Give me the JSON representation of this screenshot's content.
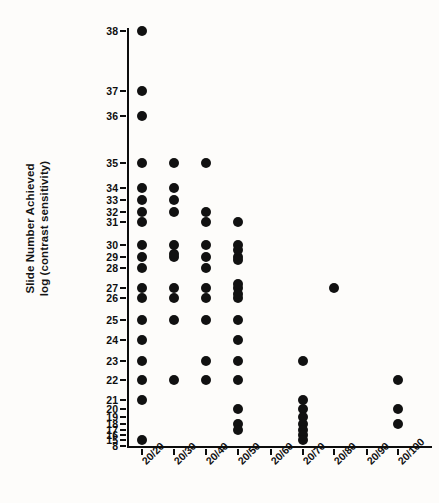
{
  "chart_data": {
    "type": "scatter",
    "title": "",
    "subtitle": "",
    "xlabel": "",
    "ylabel": "Slide Number Achieved\nlog (contrast sensitivity)",
    "grid": false,
    "legend": null,
    "x_categories": [
      "20/20",
      "20/30",
      "20/40",
      "20/50",
      "20/60",
      "20/70",
      "20/80",
      "20/90",
      "20/100"
    ],
    "y_tick_labels": [
      "38",
      "37",
      "36",
      "35",
      "34",
      "33",
      "32",
      "31",
      "30",
      "29",
      "28",
      "27",
      "26",
      "25",
      "24",
      "23",
      "22",
      "21",
      "20",
      "19",
      "18",
      "17",
      "16",
      "15",
      "8"
    ],
    "y_axis_note": "non-linear (log contrast sensitivity) spacing",
    "y_axis_pixel_positions": [
      3,
      63,
      88,
      135,
      160,
      172,
      184,
      194,
      217,
      229,
      240,
      260,
      270,
      292,
      312,
      333,
      352,
      372,
      381,
      389,
      396,
      402,
      407,
      412,
      418
    ],
    "x_axis_pixel_positions": [
      15,
      47,
      79,
      111,
      144,
      176,
      207,
      240,
      271
    ],
    "marker": {
      "shape": "circle",
      "color": "#111111",
      "size_px": 10
    },
    "points": [
      {
        "x": "20/20",
        "y": "38"
      },
      {
        "x": "20/20",
        "y": "37"
      },
      {
        "x": "20/20",
        "y": "36"
      },
      {
        "x": "20/20",
        "y": "35"
      },
      {
        "x": "20/20",
        "y": "34"
      },
      {
        "x": "20/20",
        "y": "33"
      },
      {
        "x": "20/20",
        "y": "32"
      },
      {
        "x": "20/20",
        "y": "31"
      },
      {
        "x": "20/20",
        "y": "30"
      },
      {
        "x": "20/20",
        "y": "29"
      },
      {
        "x": "20/20",
        "y": "28"
      },
      {
        "x": "20/20",
        "y": "27"
      },
      {
        "x": "20/20",
        "y": "26"
      },
      {
        "x": "20/20",
        "y": "25"
      },
      {
        "x": "20/20",
        "y": "24"
      },
      {
        "x": "20/20",
        "y": "23"
      },
      {
        "x": "20/20",
        "y": "22"
      },
      {
        "x": "20/20",
        "y": "21"
      },
      {
        "x": "20/20",
        "y": "15"
      },
      {
        "x": "20/30",
        "y": "35"
      },
      {
        "x": "20/30",
        "y": "34"
      },
      {
        "x": "20/30",
        "y": "33"
      },
      {
        "x": "20/30",
        "y": "32"
      },
      {
        "x": "20/30",
        "y": "30"
      },
      {
        "x": "20/30",
        "y": "29"
      },
      {
        "x": "20/30",
        "y": "27"
      },
      {
        "x": "20/30",
        "y": "26"
      },
      {
        "x": "20/30",
        "y": "25"
      },
      {
        "x": "20/30",
        "y": "22"
      },
      {
        "x": "20/40",
        "y": "35"
      },
      {
        "x": "20/40",
        "y": "32"
      },
      {
        "x": "20/40",
        "y": "31"
      },
      {
        "x": "20/40",
        "y": "30"
      },
      {
        "x": "20/40",
        "y": "29"
      },
      {
        "x": "20/40",
        "y": "28"
      },
      {
        "x": "20/40",
        "y": "27"
      },
      {
        "x": "20/40",
        "y": "26"
      },
      {
        "x": "20/40",
        "y": "25"
      },
      {
        "x": "20/40",
        "y": "23"
      },
      {
        "x": "20/40",
        "y": "22"
      },
      {
        "x": "20/50",
        "y": "31"
      },
      {
        "x": "20/50",
        "y": "30"
      },
      {
        "x": "20/50",
        "y": "29"
      },
      {
        "x": "20/50",
        "y": "27"
      },
      {
        "x": "20/50",
        "y": "26"
      },
      {
        "x": "20/50",
        "y": "25"
      },
      {
        "x": "20/50",
        "y": "24"
      },
      {
        "x": "20/50",
        "y": "23"
      },
      {
        "x": "20/50",
        "y": "22"
      },
      {
        "x": "20/50",
        "y": "20"
      },
      {
        "x": "20/50",
        "y": "18"
      },
      {
        "x": "20/50",
        "y": "17"
      },
      {
        "x": "20/70",
        "y": "23"
      },
      {
        "x": "20/70",
        "y": "21"
      },
      {
        "x": "20/70",
        "y": "20"
      },
      {
        "x": "20/70",
        "y": "19"
      },
      {
        "x": "20/70",
        "y": "18"
      },
      {
        "x": "20/70",
        "y": "17"
      },
      {
        "x": "20/70",
        "y": "16"
      },
      {
        "x": "20/70",
        "y": "15"
      },
      {
        "x": "20/80",
        "y": "27"
      },
      {
        "x": "20/100",
        "y": "22"
      },
      {
        "x": "20/100",
        "y": "20"
      },
      {
        "x": "20/100",
        "y": "18"
      }
    ],
    "extra_points_pixel": [
      {
        "x_px": 47,
        "y_px": 226,
        "note": "20/30 between 30 and 29"
      },
      {
        "x_px": 111,
        "y_px": 222,
        "note": "20/50 near 30"
      },
      {
        "x_px": 111,
        "y_px": 232,
        "note": "20/50 near 29"
      },
      {
        "x_px": 111,
        "y_px": 256,
        "note": "20/50 near 27"
      },
      {
        "x_px": 111,
        "y_px": 266,
        "note": "20/50 near 26"
      }
    ]
  }
}
